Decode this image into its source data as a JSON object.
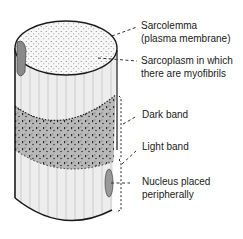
{
  "diagram": {
    "labels": {
      "sarcolemma_line1": "Sarcolemma",
      "sarcolemma_line2": "(plasma membrane)",
      "sarcoplasm_line1": "Sarcoplasm in which",
      "sarcoplasm_line2": "there are myofibrils",
      "dark_band": "Dark band",
      "light_band": "Light band",
      "nucleus_line1": "Nucleus placed",
      "nucleus_line2": "peripherally"
    },
    "colors": {
      "outline": "#1a1a1a",
      "light_fill": "#ededed",
      "dark_band_fill": "#b9b9b9",
      "top_face_fill": "#f7f7f7",
      "nucleus_fill": "#8a8a8a",
      "text": "#1a1a1a"
    }
  }
}
